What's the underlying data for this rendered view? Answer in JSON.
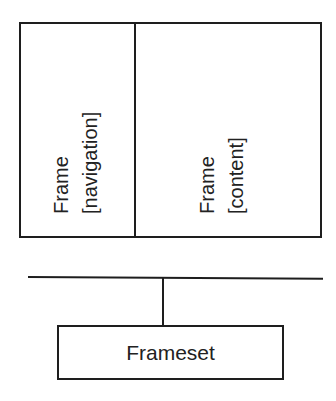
{
  "diagram": {
    "frames": [
      {
        "title": "Frame",
        "subtitle": "[navigation]"
      },
      {
        "title": "Frame",
        "subtitle": "[content]"
      }
    ],
    "frameset": {
      "label": "Frameset"
    },
    "colors": {
      "stroke": "#1e1e1e",
      "text": "#222222",
      "background": "#ffffff"
    }
  }
}
